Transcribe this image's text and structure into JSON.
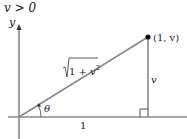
{
  "title": "v > 0",
  "axis": {
    "y_label": "y"
  },
  "triangle": {
    "hypotenuse_label": "√(1 + v²)",
    "hyp_radicand_1": "1 + ",
    "hyp_radicand_v": "v",
    "hyp_exp": "2",
    "vertical_label": "v",
    "base_label": "1",
    "angle_label": "θ",
    "point_label": "(1, v)"
  },
  "colors": {
    "line": "#808080",
    "point": "#111111",
    "text": "#222222"
  }
}
